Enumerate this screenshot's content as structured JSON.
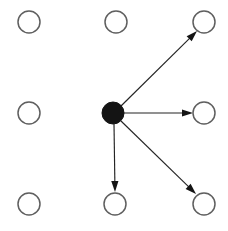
{
  "canvas": {
    "width": 228,
    "height": 231,
    "background_color": "#ffffff"
  },
  "diagram": {
    "node_radius": 11,
    "filled_node_radius": 11,
    "open_node_fill": "#ffffff",
    "open_node_stroke": "#5f5f5f",
    "filled_node_color": "#141414",
    "edge_color": "#242424",
    "edge_width": 1.15,
    "arrowhead_length": 11,
    "arrowhead_halfwidth": 3.6
  },
  "nodes": [
    {
      "id": "n-top-left",
      "label": "",
      "row": 0,
      "col": 0,
      "cx": 29,
      "cy": 22,
      "r": 11,
      "state": "open"
    },
    {
      "id": "n-top-center",
      "label": "",
      "row": 0,
      "col": 1,
      "cx": 116,
      "cy": 22,
      "r": 11,
      "state": "open"
    },
    {
      "id": "n-top-right",
      "label": "",
      "row": 0,
      "col": 2,
      "cx": 204,
      "cy": 22,
      "r": 11,
      "state": "open"
    },
    {
      "id": "n-mid-left",
      "label": "",
      "row": 1,
      "col": 0,
      "cx": 29,
      "cy": 113,
      "r": 11,
      "state": "open"
    },
    {
      "id": "n-mid-center",
      "label": "",
      "row": 1,
      "col": 1,
      "cx": 113,
      "cy": 113,
      "r": 11,
      "state": "filled"
    },
    {
      "id": "n-mid-right",
      "label": "",
      "row": 1,
      "col": 2,
      "cx": 204,
      "cy": 113,
      "r": 11,
      "state": "open"
    },
    {
      "id": "n-bottom-left",
      "label": "",
      "row": 2,
      "col": 0,
      "cx": 29,
      "cy": 204,
      "r": 11,
      "state": "open"
    },
    {
      "id": "n-bottom-center",
      "label": "",
      "row": 2,
      "col": 1,
      "cx": 115,
      "cy": 204,
      "r": 11,
      "state": "open"
    },
    {
      "id": "n-bottom-right",
      "label": "",
      "row": 2,
      "col": 2,
      "cx": 204,
      "cy": 204,
      "r": 11,
      "state": "open"
    }
  ],
  "edges": [
    {
      "id": "e-center-to-top-right",
      "label": "",
      "from": "n-mid-center",
      "to": "n-top-right",
      "x1": 121,
      "y1": 106,
      "x2": 197,
      "y2": 31,
      "directed": true
    },
    {
      "id": "e-center-to-mid-right",
      "label": "",
      "from": "n-mid-center",
      "to": "n-mid-right",
      "x1": 124,
      "y1": 113,
      "x2": 193,
      "y2": 113,
      "directed": true
    },
    {
      "id": "e-center-to-bottom-center",
      "label": "",
      "from": "n-mid-center",
      "to": "n-bottom-center",
      "x1": 114,
      "y1": 124,
      "x2": 115,
      "y2": 192,
      "directed": true
    },
    {
      "id": "e-center-to-bottom-right",
      "label": "",
      "from": "n-mid-center",
      "to": "n-bottom-right",
      "x1": 121,
      "y1": 121,
      "x2": 196,
      "y2": 194,
      "directed": true
    }
  ]
}
